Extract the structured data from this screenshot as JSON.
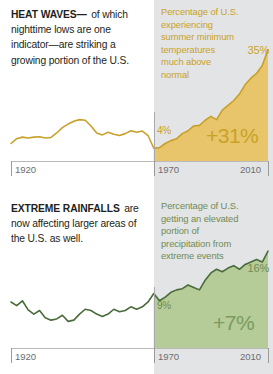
{
  "colors": {
    "heat_line": "#c8a02a",
    "heat_fill": "#e8c46a",
    "heat_text": "#c9a227",
    "rain_line": "#4a6b3a",
    "rain_fill": "#b5cb98",
    "rain_text": "#6f8b54",
    "band": "#e3e4e6",
    "axis": "#b9b9b9",
    "axis_text": "#6d6e71",
    "headline_text": "#231f20"
  },
  "heat": {
    "kicker": "HEAT WAVES—",
    "body": "of which nighttime lows are one indicator—are striking a growing portion of the U.S.",
    "caption": "Percentage of U.S. experiencing summer minimum temperatures much above normal",
    "start_value": "4%",
    "end_value": "35%",
    "change": "+31%",
    "axis": {
      "left": "1920",
      "mid": "1970",
      "right": "2010"
    }
  },
  "rain": {
    "kicker": "EXTREME RAINFALLS",
    "body": "are now affecting larger areas of the U.S. as well.",
    "caption": "Percentage of U.S. getting an elevated portion of precipitation from extreme events",
    "start_value": "9%",
    "end_value": "16%",
    "change": "+7%",
    "axis": {
      "left": "1920",
      "mid": "1970",
      "right": "2010"
    }
  },
  "chart_data": [
    {
      "type": "area",
      "title": "Percentage of U.S. experiencing summer minimum temperatures much above normal",
      "xlabel": "Year",
      "ylabel": "Percent of U.S.",
      "xlim": [
        1920,
        2010
      ],
      "ylim": [
        0,
        38
      ],
      "grid": false,
      "legend": null,
      "annotations": [
        {
          "text": "4%",
          "x": 1970,
          "y": 4
        },
        {
          "text": "35%",
          "x": 2010,
          "y": 35
        },
        {
          "text": "+31%",
          "x": 1992,
          "y": 6
        }
      ],
      "highlight_span": [
        1970,
        2010
      ],
      "x": [
        1920,
        1922,
        1924,
        1926,
        1928,
        1930,
        1932,
        1934,
        1936,
        1938,
        1940,
        1942,
        1944,
        1946,
        1948,
        1950,
        1952,
        1954,
        1956,
        1958,
        1960,
        1962,
        1964,
        1966,
        1968,
        1970,
        1972,
        1974,
        1976,
        1978,
        1980,
        1982,
        1984,
        1986,
        1988,
        1990,
        1992,
        1994,
        1996,
        1998,
        2000,
        2002,
        2004,
        2006,
        2008,
        2010
      ],
      "values": [
        5.5,
        7.0,
        7.5,
        7.2,
        7.5,
        7.6,
        7.2,
        7.4,
        8.8,
        10.5,
        11.6,
        12.5,
        13.0,
        12.8,
        11.0,
        8.8,
        8.2,
        9.0,
        8.4,
        8.0,
        8.6,
        9.5,
        9.0,
        9.4,
        8.0,
        4.0,
        4.2,
        5.5,
        6.4,
        7.0,
        8.6,
        9.5,
        11.0,
        11.2,
        12.8,
        14.0,
        13.0,
        16.0,
        17.5,
        19.0,
        21.0,
        24.0,
        26.0,
        27.5,
        30.0,
        35.0
      ]
    },
    {
      "type": "area",
      "title": "Percentage of U.S. getting an elevated portion of precipitation from extreme events",
      "xlabel": "Year",
      "ylabel": "Percent of U.S.",
      "xlim": [
        1920,
        2010
      ],
      "ylim": [
        0,
        18
      ],
      "grid": false,
      "legend": null,
      "annotations": [
        {
          "text": "9%",
          "x": 1970,
          "y": 9
        },
        {
          "text": "16%",
          "x": 2010,
          "y": 16
        },
        {
          "text": "+7%",
          "x": 1995,
          "y": 3
        }
      ],
      "highlight_span": [
        1970,
        2010
      ],
      "x": [
        1920,
        1922,
        1924,
        1926,
        1928,
        1930,
        1932,
        1934,
        1936,
        1938,
        1940,
        1942,
        1944,
        1946,
        1948,
        1950,
        1952,
        1954,
        1956,
        1958,
        1960,
        1962,
        1964,
        1966,
        1968,
        1970,
        1972,
        1974,
        1976,
        1978,
        1980,
        1982,
        1984,
        1986,
        1988,
        1990,
        1992,
        1994,
        1996,
        1998,
        2000,
        2002,
        2004,
        2006,
        2008,
        2010
      ],
      "values": [
        7.6,
        7.0,
        7.8,
        6.3,
        5.6,
        6.2,
        5.0,
        4.6,
        4.8,
        5.4,
        4.4,
        4.6,
        5.6,
        6.4,
        6.2,
        5.6,
        5.2,
        5.6,
        6.4,
        6.0,
        6.2,
        6.8,
        6.4,
        6.8,
        7.6,
        9.0,
        7.8,
        8.4,
        9.2,
        9.6,
        9.8,
        10.4,
        10.0,
        9.6,
        11.2,
        12.4,
        13.0,
        12.6,
        13.2,
        13.6,
        13.0,
        13.8,
        14.2,
        14.6,
        14.2,
        16.0
      ]
    }
  ]
}
